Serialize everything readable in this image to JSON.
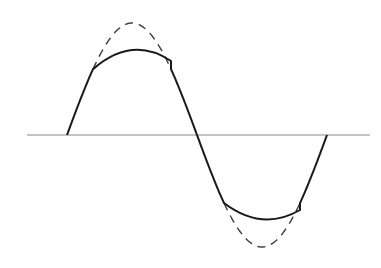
{
  "diagram": {
    "colors": {
      "background": "#ffffff",
      "axis": "#8a8a8a",
      "clipped_wave": "#1a1a1a",
      "ideal_wave": "#3a3a3a"
    },
    "axis": {
      "y": 135,
      "x_start": 27,
      "x_end": 370
    },
    "ideal_wave": {
      "style": "dashed",
      "start_x": 67,
      "zero_cross_x": 197,
      "end_x": 327,
      "peak_y": 23,
      "trough_y": 247
    },
    "clipped_wave": {
      "style": "solid",
      "positive_clip_corners": [
        [
          93,
          61
        ],
        [
          171,
          61
        ]
      ],
      "positive_flat_peak_y": 48,
      "negative_clip_corners": [
        [
          224,
          210
        ],
        [
          300,
          210
        ]
      ],
      "negative_flat_trough_y": 221
    },
    "cut_off_text": ""
  }
}
